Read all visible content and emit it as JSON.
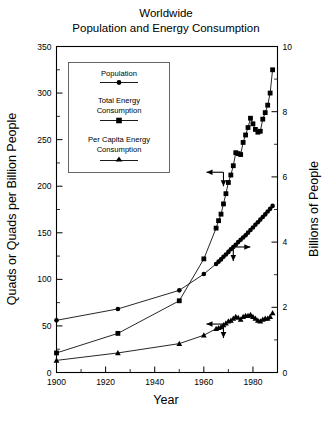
{
  "chart_data": {
    "type": "line",
    "title": "Worldwide\nPopulation and Energy Consumption",
    "title_line1": "Worldwide",
    "title_line2": "Population and Energy Consumption",
    "xlabel": "Year",
    "ylabel": "Quads or Quads per Billion People",
    "ylabel_right": "Billions of People",
    "xlim": [
      1900,
      1990
    ],
    "ylim": [
      0,
      350
    ],
    "ylim_right": [
      0,
      10
    ],
    "xticks": [
      1900,
      1920,
      1940,
      1960,
      1980
    ],
    "xticks_minor": [
      1910,
      1930,
      1950,
      1970,
      1990
    ],
    "yticks": [
      0,
      50,
      100,
      150,
      200,
      250,
      300,
      350
    ],
    "yticks_minor": [
      25,
      75,
      125,
      175,
      225,
      275,
      325
    ],
    "yticks_right": [
      0,
      2,
      4,
      6,
      8,
      10
    ],
    "yticks_right_minor": [
      1,
      3,
      5,
      7,
      9
    ],
    "grid": false,
    "legend_position": "upper-left-inside",
    "colors": {
      "line": "#000000",
      "marker": "#000000",
      "frame": "#000000",
      "legend_border": "#555555"
    },
    "series": [
      {
        "name": "Population",
        "marker": "circle",
        "axis": "right",
        "units": "Billions of People",
        "x": [
          1900,
          1925,
          1950,
          1960,
          1965,
          1966,
          1967,
          1968,
          1969,
          1970,
          1971,
          1972,
          1973,
          1974,
          1975,
          1976,
          1977,
          1978,
          1979,
          1980,
          1981,
          1982,
          1983,
          1984,
          1985,
          1986,
          1987,
          1988
        ],
        "values": [
          1.6,
          1.95,
          2.52,
          3.02,
          3.33,
          3.4,
          3.47,
          3.55,
          3.62,
          3.7,
          3.78,
          3.85,
          3.92,
          4.0,
          4.07,
          4.14,
          4.21,
          4.29,
          4.37,
          4.45,
          4.53,
          4.61,
          4.69,
          4.77,
          4.85,
          4.94,
          5.02,
          5.11
        ]
      },
      {
        "name": "Total Energy Consumption",
        "marker": "square",
        "axis": "left",
        "units": "Quads",
        "x": [
          1900,
          1925,
          1950,
          1960,
          1965,
          1966,
          1967,
          1968,
          1969,
          1970,
          1971,
          1972,
          1973,
          1974,
          1975,
          1976,
          1977,
          1978,
          1979,
          1980,
          1981,
          1982,
          1983,
          1984,
          1985,
          1986,
          1987,
          1988
        ],
        "values": [
          21,
          42,
          77,
          122,
          155,
          163,
          170,
          181,
          192,
          204,
          212,
          222,
          236,
          235,
          234,
          247,
          255,
          263,
          273,
          267,
          261,
          258,
          259,
          272,
          279,
          287,
          300,
          325
        ]
      },
      {
        "name": "Per Capita Energy Consumption",
        "marker": "triangle",
        "axis": "left",
        "units": "Quads per Billion People",
        "x": [
          1900,
          1925,
          1950,
          1960,
          1965,
          1966,
          1967,
          1968,
          1969,
          1970,
          1971,
          1972,
          1973,
          1974,
          1975,
          1976,
          1977,
          1978,
          1979,
          1980,
          1981,
          1982,
          1983,
          1984,
          1985,
          1986,
          1987,
          1988
        ],
        "values": [
          13,
          21,
          31,
          40,
          47,
          48,
          49,
          51,
          53,
          55,
          56,
          58,
          60,
          59,
          57,
          60,
          61,
          61,
          62,
          60,
          58,
          56,
          55,
          57,
          58,
          58,
          60,
          64
        ]
      }
    ],
    "annotations": [
      {
        "label": "left-axis-arrow-energy",
        "series": "Total Energy Consumption",
        "x": 1968,
        "y": 215,
        "direction": "left"
      },
      {
        "label": "right-axis-arrow-population",
        "series": "Population",
        "x": 1972,
        "y": 3.85,
        "direction": "right"
      },
      {
        "label": "left-axis-arrow-percapita",
        "series": "Per Capita Energy Consumption",
        "x": 1968,
        "y": 52,
        "direction": "left"
      }
    ]
  },
  "legend": {
    "entries": [
      {
        "label": "Population",
        "marker": "circle"
      },
      {
        "label_line1": "Total Energy",
        "label_line2": "Consumption",
        "marker": "square"
      },
      {
        "label_line1": "Per Capita Energy",
        "label_line2": "Consumption",
        "marker": "triangle"
      }
    ]
  }
}
